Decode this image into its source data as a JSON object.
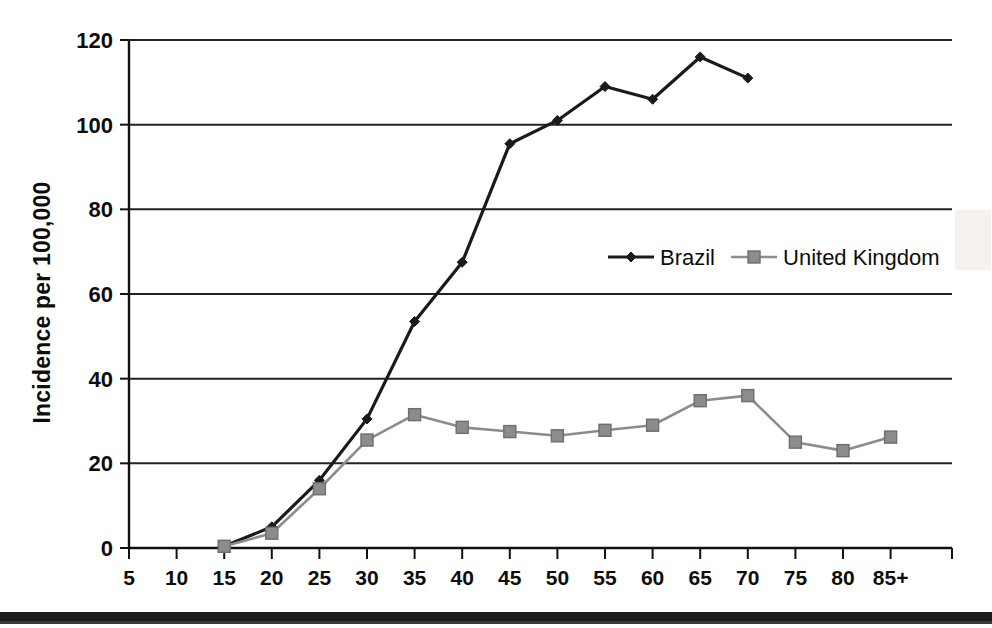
{
  "chart_data": {
    "type": "line",
    "title": "",
    "xlabel": "",
    "ylabel": "Incidence per 100,000",
    "categories": [
      "5",
      "10",
      "15",
      "20",
      "25",
      "30",
      "35",
      "40",
      "45",
      "50",
      "55",
      "60",
      "65",
      "70",
      "75",
      "80",
      "85+"
    ],
    "ylim": [
      0,
      120
    ],
    "yticks": [
      0,
      20,
      40,
      60,
      80,
      100,
      120
    ],
    "ytick_labels": [
      "0",
      "20",
      "40",
      "60",
      "80",
      "100",
      "120"
    ],
    "grid": "horizontal",
    "legend_position": "center-right-inside",
    "series": [
      {
        "name": "Brazil",
        "color": "#1a1a1a",
        "marker": "diamond",
        "values": [
          null,
          null,
          0.4,
          5.0,
          16.0,
          30.5,
          53.5,
          67.5,
          95.5,
          101.0,
          109.0,
          106.0,
          116.0,
          111.0,
          null,
          null,
          null
        ]
      },
      {
        "name": "United Kingdom",
        "color": "#8c8c8c",
        "marker": "square",
        "values": [
          null,
          null,
          0.4,
          3.5,
          14.0,
          25.5,
          31.5,
          28.5,
          27.5,
          26.5,
          27.8,
          29.0,
          34.8,
          36.0,
          25.0,
          23.0,
          26.2
        ]
      }
    ]
  },
  "legend": {
    "items": [
      {
        "label": "Brazil",
        "color": "#1a1a1a",
        "marker": "diamond"
      },
      {
        "label": "United Kingdom",
        "color": "#8c8c8c",
        "marker": "square"
      }
    ]
  },
  "axis": {
    "y_title": "Incidence per 100,000"
  }
}
